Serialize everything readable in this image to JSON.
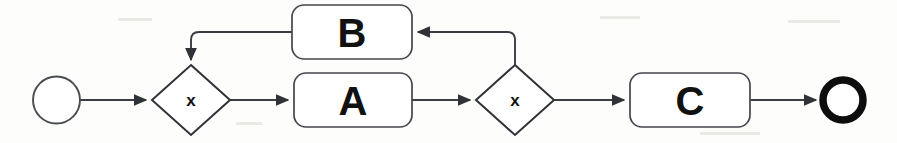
{
  "diagram": {
    "type": "bpmn-process-flow",
    "title": "",
    "background_color": "#fdfdfc",
    "line_color": "#3a3d42",
    "text_color": "#111111",
    "nodes": [
      {
        "id": "start",
        "kind": "start-event",
        "shape": "circle",
        "label": "",
        "cx": 56.5,
        "cy": 100,
        "r": 23.5
      },
      {
        "id": "gateway1",
        "kind": "exclusive-gateway",
        "shape": "diamond",
        "label": "x",
        "cx": 191,
        "cy": 100,
        "rx": 39,
        "ry": 35
      },
      {
        "id": "taskB",
        "kind": "task",
        "shape": "rounded-rect",
        "label": "B",
        "x": 292,
        "y": 5,
        "width": 120,
        "height": 54,
        "rx": 12
      },
      {
        "id": "taskA",
        "kind": "task",
        "shape": "rounded-rect",
        "label": "A",
        "x": 294,
        "y": 73,
        "width": 118,
        "height": 54,
        "rx": 12
      },
      {
        "id": "gateway2",
        "kind": "exclusive-gateway",
        "shape": "diamond",
        "label": "x",
        "cx": 515,
        "cy": 100,
        "rx": 39,
        "ry": 35
      },
      {
        "id": "taskC",
        "kind": "task",
        "shape": "rounded-rect",
        "label": "C",
        "x": 630,
        "y": 73,
        "width": 120,
        "height": 54,
        "rx": 12
      },
      {
        "id": "end",
        "kind": "end-event",
        "shape": "thick-circle",
        "label": "",
        "cx": 843,
        "cy": 100,
        "r": 20
      }
    ],
    "flows": [
      {
        "id": "f1",
        "from": "start",
        "to": "gateway1",
        "label": "",
        "path": "M 80 100 L 146 100",
        "arrow": true
      },
      {
        "id": "f2",
        "from": "gateway1",
        "to": "taskA",
        "label": "",
        "path": "M 230 100 L 288 100",
        "arrow": true
      },
      {
        "id": "f3",
        "from": "taskA",
        "to": "gateway2",
        "label": "",
        "path": "M 412 100 L 470 100",
        "arrow": true
      },
      {
        "id": "f4",
        "from": "gateway2",
        "to": "taskB",
        "label": "",
        "path": "M 515 65 L 515 40 Q 515 32 507 32 L 418 32",
        "arrow": true
      },
      {
        "id": "f5",
        "from": "taskB",
        "to": "gateway1",
        "label": "",
        "path": "M 292 32 L 199 32 Q 191 32 191 40 L 191 60",
        "arrow": true
      },
      {
        "id": "f6",
        "from": "gateway2",
        "to": "taskC",
        "label": "",
        "path": "M 554 100 L 624 100",
        "arrow": true
      },
      {
        "id": "f7",
        "from": "taskC",
        "to": "end",
        "label": "",
        "path": "M 750 100 L 816 100",
        "arrow": true
      }
    ]
  }
}
